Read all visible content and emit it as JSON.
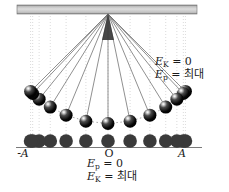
{
  "labels": {
    "top_right": {
      "line1": {
        "symbol": "E",
        "sub": "K",
        "rest": " = 0"
      },
      "line2": {
        "symbol": "E",
        "sub": "p",
        "rest": " = 최대"
      }
    },
    "bottom": {
      "line1": {
        "symbol": "E",
        "sub": "p",
        "rest": " = 0"
      },
      "line2": {
        "symbol": "E",
        "sub": "K",
        "rest": " = 최대"
      }
    },
    "axis": {
      "left": "-A",
      "center": "O",
      "right": "A"
    }
  },
  "colors": {
    "background": "#ffffff",
    "ceiling_dark": "#858585",
    "ceiling_mid": "#c2c2c2",
    "ceiling_light": "#dcdcdc",
    "ceiling_edge": "#6f6f6f",
    "string": "#6b6b6b",
    "pivot": "#383838",
    "bob_core": "#050505",
    "bob_shade": "#4a4a4a",
    "bob_highlight": "#ffffff",
    "arc_dotted": "#8f8f8f",
    "vertical_dotted": "#cccccc",
    "axis_line": "#7a7a7a",
    "projection_dot": "#3a3a3a",
    "text": "#1b1b1b"
  },
  "diagram": {
    "pivot_x": 108,
    "pivot_y": 14,
    "string_length": 109.5,
    "amplitude_deg": 45,
    "positions": 13,
    "bob_radius": 6.5,
    "ceiling": {
      "x": 17,
      "y": 5,
      "width": 180,
      "height": 9
    },
    "pivot_triangle_half_width": 6,
    "pivot_triangle_bottom": 40,
    "dotted_top": 16,
    "dotted_bottom": 146,
    "axis_y": 147.5,
    "axis_x1": 16,
    "axis_x2": 202,
    "projection_cy": 141,
    "projection_radius": 6.8
  }
}
